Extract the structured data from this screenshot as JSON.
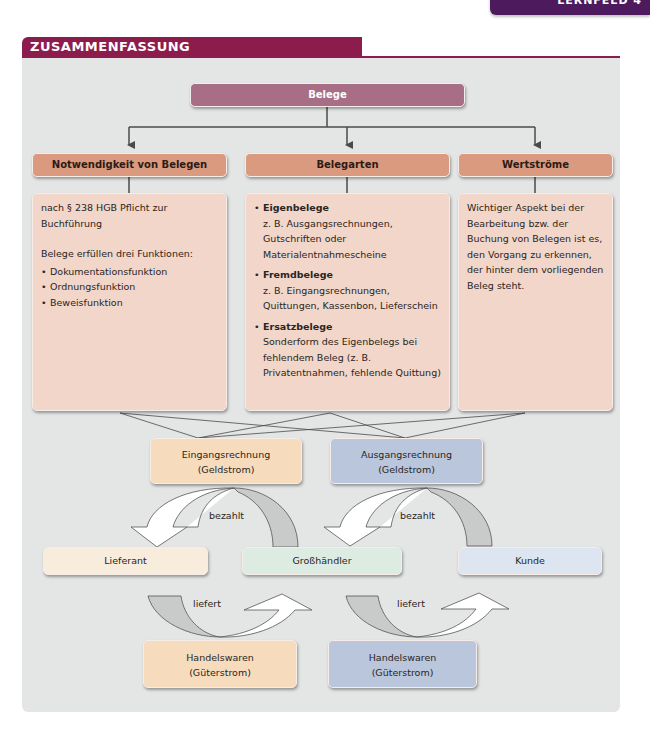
{
  "chapter_tab": {
    "label": "LERNFELD 4"
  },
  "section": {
    "title": "ZUSAMMENFASSUNG"
  },
  "colors": {
    "section_header": "#8c1c4c",
    "chapter_tab": "#4e1a5e",
    "panel_bg": "#e3e6e4",
    "root_box": "#a76e86",
    "category_box": "#d99a80",
    "content_box": "#f1d6c9",
    "incoming": "#f6dcbd",
    "outgoing": "#b9c6dc",
    "supplier": "#f8ecdc",
    "wholesaler": "#dcece2",
    "customer": "#dde6f0"
  },
  "root": {
    "label": "Belege"
  },
  "categories": [
    {
      "label": "Notwendigkeit von Belegen",
      "content": {
        "intro": "nach § 238 HGB Pflicht zur Buchführung",
        "lead": "Belege erfüllen drei Funktionen:",
        "bullets": [
          "Dokumentationsfunktion",
          "Ordnungsfunktion",
          "Beweisfunktion"
        ]
      }
    },
    {
      "label": "Belegarten",
      "content": {
        "items": [
          {
            "title": "Eigenbelege",
            "text": "z. B. Ausgangsrechnungen, Gutschriften oder Materialentnahmescheine"
          },
          {
            "title": "Fremdbelege",
            "text": "z. B. Eingangsrechnungen, Quittungen, Kassenbon, Lieferschein"
          },
          {
            "title": "Ersatzbelege",
            "text": "Sonderform des Eigenbelegs bei fehlendem Beleg (z. B. Privatentnahmen, fehlende Quittung)"
          }
        ]
      }
    },
    {
      "label": "Wertströme",
      "content": {
        "text": "Wichtiger Aspekt bei der Bearbeitung bzw. der Buchung von Belegen ist es, den Vorgang zu erkennen, der hinter dem vorliegenden Beleg steht."
      }
    }
  ],
  "money_flows": [
    {
      "line1": "Eingangsrechnung",
      "line2": "(Geldstrom)"
    },
    {
      "line1": "Ausgangsrechnung",
      "line2": "(Geldstrom)"
    }
  ],
  "actors": [
    {
      "label": "Lieferant"
    },
    {
      "label": "Großhändler"
    },
    {
      "label": "Kunde"
    }
  ],
  "goods_flows": [
    {
      "line1": "Handelswaren",
      "line2": "(Güterstrom)"
    },
    {
      "line1": "Handelswaren",
      "line2": "(Güterstrom)"
    }
  ],
  "arrow_labels": {
    "paid_left": "bezahlt",
    "paid_right": "bezahlt",
    "delivered_left": "liefert",
    "delivered_right": "liefert"
  }
}
